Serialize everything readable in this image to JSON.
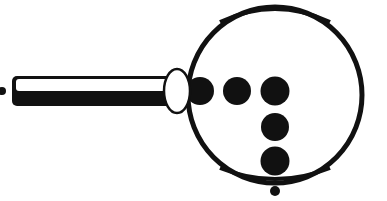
{
  "figure": {
    "colors": {
      "ink": "#111111",
      "fill_light": "#ffffff"
    },
    "handle": {
      "label": "shaft"
    },
    "connector": {
      "label": "ellipse"
    },
    "ring": {
      "label": "ring"
    },
    "dots": [
      {
        "id": "dot-1",
        "cx": 200,
        "cy": 91
      },
      {
        "id": "dot-2",
        "cx": 237,
        "cy": 91
      },
      {
        "id": "dot-3",
        "cx": 275,
        "cy": 91
      },
      {
        "id": "dot-4",
        "cx": 275,
        "cy": 127
      },
      {
        "id": "dot-5",
        "cx": 275,
        "cy": 161
      }
    ]
  }
}
